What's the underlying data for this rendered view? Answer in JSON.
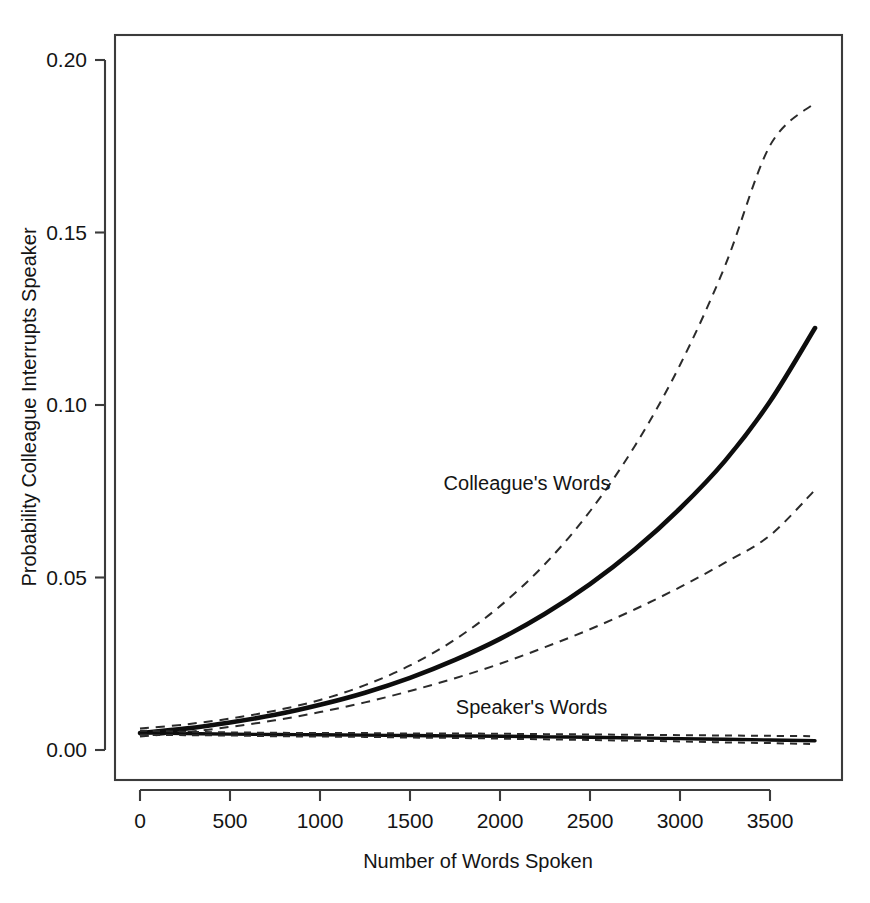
{
  "chart_data": {
    "type": "line",
    "title": "",
    "subtitle": "",
    "xlabel": "Number of Words Spoken",
    "ylabel": "Probability Colleague Interrupts Speaker",
    "xlim": [
      0,
      3750
    ],
    "ylim": [
      0.0,
      0.212
    ],
    "xticks": [
      0,
      500,
      1000,
      1500,
      2000,
      2500,
      3000,
      3500
    ],
    "xticklabels": [
      "0",
      "500",
      "1000",
      "1500",
      "2000",
      "2500",
      "3000",
      "3500"
    ],
    "yticks": [
      0.0,
      0.05,
      0.1,
      0.15,
      0.2
    ],
    "yticklabels": [
      "0.00",
      "0.05",
      "0.10",
      "0.15",
      "0.20"
    ],
    "grid": false,
    "legend_position": "inline-annotations",
    "annotations": [
      {
        "text": "Colleague's Words",
        "x": 2150,
        "y": 0.0775,
        "anchor": "middle"
      },
      {
        "text": "Speaker's Words",
        "x": 2175,
        "y": 0.0125,
        "anchor": "middle"
      }
    ],
    "x": [
      0,
      250,
      500,
      750,
      1000,
      1250,
      1500,
      1750,
      2000,
      2250,
      2500,
      2750,
      3000,
      3250,
      3500,
      3750
    ],
    "series": [
      {
        "name": "Colleague's Words",
        "style": "solid",
        "width": "thick",
        "values": [
          0.0049,
          0.0062,
          0.008,
          0.0102,
          0.0131,
          0.0166,
          0.0209,
          0.0261,
          0.0322,
          0.0395,
          0.0481,
          0.0582,
          0.07,
          0.0838,
          0.101,
          0.1223
        ]
      },
      {
        "name": "Colleague's Words upper 95% CI",
        "style": "dashed",
        "width": "thin",
        "values": [
          0.0062,
          0.0074,
          0.0091,
          0.0114,
          0.0145,
          0.0188,
          0.0245,
          0.032,
          0.0417,
          0.0539,
          0.0692,
          0.0882,
          0.1116,
          0.1403,
          0.1752,
          0.1876
        ]
      },
      {
        "name": "Colleague's Words lower 95% CI",
        "style": "dashed",
        "width": "thin",
        "values": [
          0.0039,
          0.0051,
          0.0067,
          0.0086,
          0.011,
          0.0138,
          0.0171,
          0.0208,
          0.025,
          0.0298,
          0.035,
          0.0408,
          0.0472,
          0.0543,
          0.0622,
          0.0754
        ]
      },
      {
        "name": "Speaker's Words",
        "style": "solid",
        "width": "medium",
        "values": [
          0.005,
          0.0048,
          0.0046,
          0.0045,
          0.0044,
          0.0043,
          0.0042,
          0.0041,
          0.004,
          0.0038,
          0.0037,
          0.0035,
          0.0033,
          0.0031,
          0.0029,
          0.0027
        ]
      },
      {
        "name": "Speaker's Words upper 95% CI",
        "style": "dashed",
        "width": "thin",
        "values": [
          0.0056,
          0.0053,
          0.0051,
          0.005,
          0.0049,
          0.0049,
          0.0048,
          0.0048,
          0.0047,
          0.0046,
          0.0045,
          0.0044,
          0.0043,
          0.0042,
          0.0041,
          0.004
        ]
      },
      {
        "name": "Speaker's Words lower 95% CI",
        "style": "dashed",
        "width": "thin",
        "values": [
          0.0044,
          0.0043,
          0.0042,
          0.004,
          0.0039,
          0.0038,
          0.0036,
          0.0035,
          0.0033,
          0.0031,
          0.0029,
          0.0027,
          0.0025,
          0.0022,
          0.002,
          0.0017
        ]
      }
    ],
    "colors": {
      "line": "#0d0d0d",
      "ci": "#2b2b2b",
      "axis": "#3b3b3b",
      "text": "#141414",
      "background": "#ffffff"
    }
  }
}
